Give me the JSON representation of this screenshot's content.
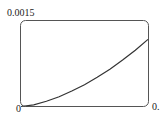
{
  "chart_data": {
    "type": "line",
    "title": "",
    "xlabel": "",
    "ylabel": "",
    "y_tick_labels": [
      "0",
      "0.0015"
    ],
    "x_tick_labels": [
      "0",
      "0."
    ],
    "ylim": [
      0,
      0.0015
    ],
    "grid": false,
    "legend": null,
    "series": [
      {
        "name": "curve",
        "x": [
          0,
          0.1,
          0.2,
          0.3,
          0.4,
          0.5,
          0.6,
          0.7,
          0.8,
          0.9,
          1.0
        ],
        "y": [
          0,
          3e-05,
          9e-05,
          0.00017,
          0.00027,
          0.00038,
          0.00051,
          0.00065,
          0.00081,
          0.00098,
          0.00117
        ]
      }
    ],
    "line_color": "#333333"
  },
  "labels": {
    "y_top": "0.0015",
    "origin": "0",
    "x_right": "0."
  }
}
